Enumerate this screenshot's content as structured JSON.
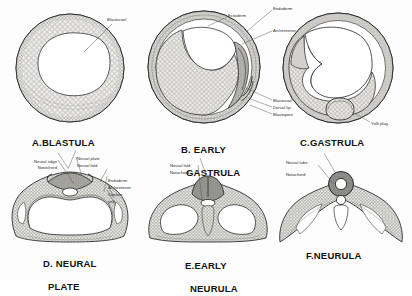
{
  "figure": {
    "title_visible": false,
    "background_color": "#fdfdfd",
    "ink_color": "#2a2a2a",
    "style": "grayscale stippled-cell line drawing, amphibian (frog) embryology series"
  },
  "panels": [
    {
      "id": "A",
      "caption": "A.BLASTULA",
      "caption_lines": [
        "A.BLASTULA"
      ],
      "labels": [
        {
          "text": "Blastocoel",
          "anchor": "top-right"
        }
      ]
    },
    {
      "id": "B",
      "caption": "B. EARLY GASTRULA",
      "caption_lines": [
        "B. EARLY",
        "GASTRULA"
      ],
      "labels": [
        {
          "text": "Ectoderm",
          "anchor": "top"
        },
        {
          "text": "Endoderm",
          "anchor": "top-right"
        },
        {
          "text": "Archenteron",
          "anchor": "right"
        },
        {
          "text": "Blastocoel",
          "anchor": "bottom-right"
        },
        {
          "text": "Dorsal lip",
          "anchor": "bottom-right"
        },
        {
          "text": "Blastopore",
          "anchor": "bottom-right"
        }
      ]
    },
    {
      "id": "C",
      "caption": "C.GASTRULA",
      "caption_lines": [
        "C.GASTRULA"
      ],
      "labels": [
        {
          "text": "Yolk plug",
          "anchor": "bottom-right"
        }
      ]
    },
    {
      "id": "D",
      "caption": "D. NEURAL PLATE",
      "caption_lines": [
        "D. NEURAL",
        "PLATE"
      ],
      "labels": [
        {
          "text": "Neural ridge",
          "anchor": "top-left"
        },
        {
          "text": "Notochord",
          "anchor": "top-left"
        },
        {
          "text": "Neural plate",
          "anchor": "top"
        },
        {
          "text": "Neural fold",
          "anchor": "top"
        },
        {
          "text": "Endoderm",
          "anchor": "right"
        },
        {
          "text": "Archenteron",
          "anchor": "right"
        },
        {
          "text": "Coelom",
          "anchor": "right"
        },
        {
          "text": "yolk",
          "anchor": "right"
        }
      ]
    },
    {
      "id": "E",
      "caption": "E.EARLY NEURULA",
      "caption_lines": [
        "E.EARLY",
        "NEURULA"
      ],
      "labels": [
        {
          "text": "Neural fold",
          "anchor": "top"
        },
        {
          "text": "Notochord",
          "anchor": "top-left"
        }
      ]
    },
    {
      "id": "F",
      "caption": "F.NEURULA",
      "caption_lines": [
        "F.NEURULA"
      ],
      "labels": [
        {
          "text": "Neural tube",
          "anchor": "top"
        },
        {
          "text": "Notochord",
          "anchor": "top-left"
        }
      ]
    }
  ]
}
